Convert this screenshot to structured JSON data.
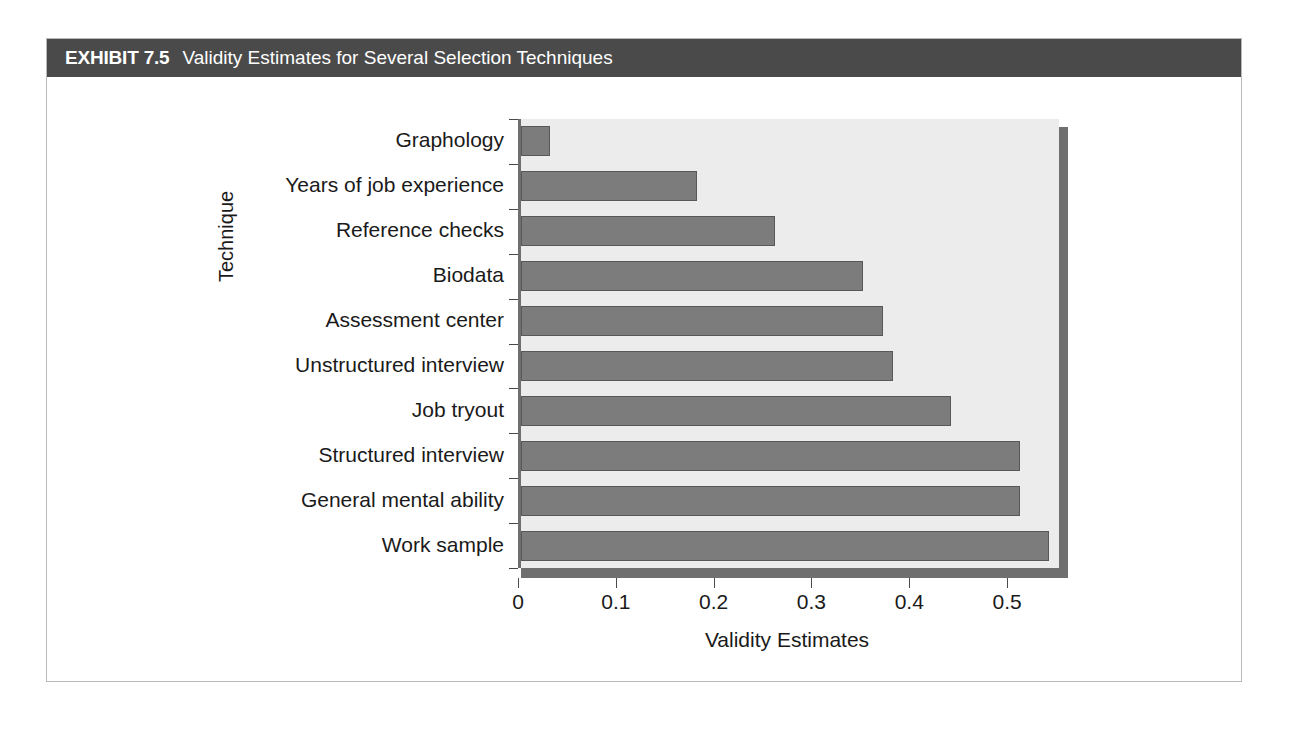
{
  "exhibit": {
    "label": "EXHIBIT 7.5",
    "title": "Validity Estimates for Several Selection Techniques"
  },
  "colors": {
    "title_bar_bg": "#4a4a4a",
    "title_bar_text": "#ffffff",
    "plot_bg": "#ececed",
    "bar_fill": "#7c7c7c",
    "bar_border": "#585858",
    "axis": "#4a4a4a",
    "shadow": "#6f6f6f",
    "frame_border": "#b9b9b9"
  },
  "chart_data": {
    "type": "bar",
    "orientation": "horizontal",
    "title": "Validity Estimates for Several Selection Techniques",
    "xlabel": "Validity Estimates",
    "ylabel": "Technique",
    "categories": [
      "Graphology",
      "Years of job experience",
      "Reference checks",
      "Biodata",
      "Assessment center",
      "Unstructured interview",
      "Job tryout",
      "Structured interview",
      "General mental ability",
      "Work sample"
    ],
    "values": [
      0.03,
      0.18,
      0.26,
      0.35,
      0.37,
      0.38,
      0.44,
      0.51,
      0.51,
      0.54
    ],
    "xlim": [
      0,
      0.55
    ],
    "xticks": [
      0,
      0.1,
      0.2,
      0.3,
      0.4,
      0.5
    ],
    "xtick_labels": [
      "0",
      "0.1",
      "0.2",
      "0.3",
      "0.4",
      "0.5"
    ],
    "grid": false,
    "legend": null
  }
}
